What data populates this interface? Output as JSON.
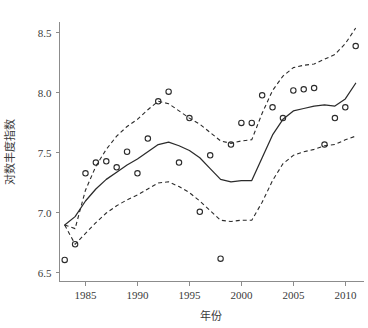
{
  "chart_data": {
    "type": "scatter",
    "title": "",
    "subtitle": "",
    "xlabel": "年份",
    "ylabel": "对数丰度指数",
    "xlim": [
      1982.5,
      2011.8
    ],
    "ylim": [
      6.42,
      8.58
    ],
    "grid": false,
    "legend": null,
    "x_ticks": [
      1985,
      1990,
      1995,
      2000,
      2005,
      2010
    ],
    "x_tick_labels": [
      "1985",
      "1990",
      "1995",
      "2000",
      "2005",
      "2010"
    ],
    "y_ticks": [
      6.5,
      7.0,
      7.5,
      8.0,
      8.5
    ],
    "y_tick_labels": [
      "6.5",
      "7.0",
      "7.5",
      "8.0",
      "8.5"
    ],
    "x": [
      1983,
      1984,
      1985,
      1986,
      1987,
      1988,
      1989,
      1990,
      1991,
      1992,
      1993,
      1994,
      1995,
      1996,
      1997,
      1998,
      1999,
      2000,
      2001,
      2002,
      2003,
      2004,
      2005,
      2006,
      2007,
      2008,
      2009,
      2010,
      2011
    ],
    "series": [
      {
        "name": "观测值",
        "type": "scatter",
        "marker": "open-circle",
        "color": "#2b2b2b",
        "values": [
          6.6,
          6.73,
          7.32,
          7.41,
          7.42,
          7.37,
          7.5,
          7.32,
          7.61,
          7.92,
          8.0,
          7.41,
          7.78,
          7.0,
          7.47,
          6.61,
          7.56,
          7.74,
          7.74,
          7.97,
          7.87,
          7.78,
          8.01,
          8.02,
          8.03,
          7.56,
          7.78,
          7.87,
          8.38
        ]
      },
      {
        "name": "拟合曲线",
        "type": "line",
        "style": "solid",
        "color": "#2b2b2b",
        "values": [
          6.89,
          6.96,
          7.09,
          7.19,
          7.27,
          7.33,
          7.39,
          7.44,
          7.5,
          7.56,
          7.58,
          7.55,
          7.51,
          7.45,
          7.36,
          7.27,
          7.25,
          7.26,
          7.26,
          7.45,
          7.64,
          7.77,
          7.84,
          7.86,
          7.88,
          7.89,
          7.88,
          7.94,
          8.07
        ]
      },
      {
        "name": "置信上限",
        "type": "line",
        "style": "dashed",
        "color": "#2b2b2b",
        "values": [
          6.89,
          6.86,
          7.18,
          7.38,
          7.52,
          7.63,
          7.71,
          7.77,
          7.85,
          7.92,
          7.9,
          7.84,
          7.78,
          7.73,
          7.66,
          7.59,
          7.57,
          7.59,
          7.6,
          7.82,
          8.01,
          8.13,
          8.2,
          8.22,
          8.23,
          8.27,
          8.31,
          8.4,
          8.53
        ]
      },
      {
        "name": "置信下限",
        "type": "line",
        "style": "dashed",
        "color": "#2b2b2b",
        "values": [
          6.89,
          6.73,
          6.82,
          6.91,
          6.99,
          7.05,
          7.1,
          7.14,
          7.19,
          7.24,
          7.25,
          7.21,
          7.16,
          7.09,
          7.01,
          6.93,
          6.92,
          6.93,
          6.93,
          7.08,
          7.26,
          7.4,
          7.47,
          7.5,
          7.52,
          7.55,
          7.56,
          7.6,
          7.63
        ]
      }
    ]
  },
  "axis": {
    "x_title": "年份",
    "y_title": "对数丰度指数"
  }
}
